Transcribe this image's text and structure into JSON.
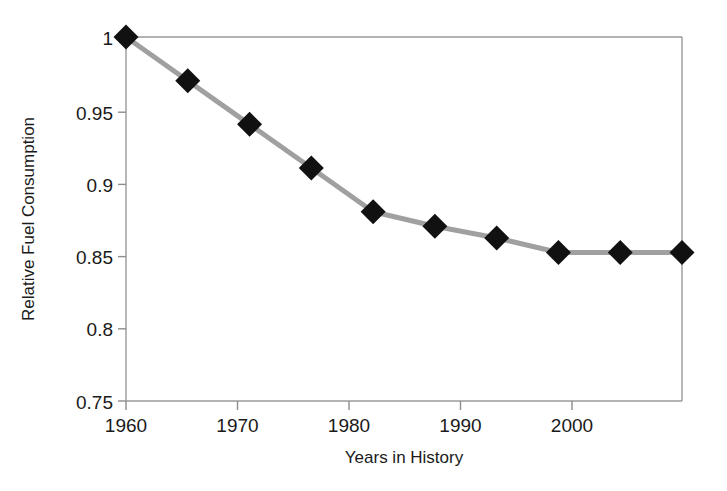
{
  "chart_data": {
    "type": "line",
    "title": "",
    "xlabel": "Years in History",
    "ylabel": "Relative Fuel Consumption",
    "xlim": [
      1960,
      2005
    ],
    "ylim": [
      0.75,
      1.0
    ],
    "grid": false,
    "legend": "none",
    "x": [
      1960,
      1965,
      1970,
      1975,
      1980,
      1985,
      1990,
      1995,
      2000,
      2005
    ],
    "values": [
      1.0,
      0.97,
      0.94,
      0.91,
      0.88,
      0.87,
      0.862,
      0.852,
      0.852,
      0.852
    ],
    "series": [
      {
        "name": "Relative Fuel Consumption",
        "values": [
          1.0,
          0.97,
          0.94,
          0.91,
          0.88,
          0.87,
          0.862,
          0.852,
          0.852,
          0.852
        ]
      }
    ],
    "x_ticks": [
      1960,
      1970,
      1980,
      1990,
      2000
    ],
    "x_tick_labels": [
      "1960",
      "1970",
      "1980",
      "1990",
      "2000"
    ],
    "y_ticks": [
      0.75,
      0.8,
      0.85,
      0.9,
      0.95,
      1.0
    ],
    "y_tick_labels": [
      "0.75",
      "0.8",
      "0.85",
      "0.9",
      "0.95",
      "1"
    ],
    "marker": "diamond",
    "marker_color": "#111111",
    "line_color": "#a0a0a0",
    "frame_color": "#9a9a9a",
    "background_color": "#ffffff"
  },
  "axes": {
    "x_title": "Years in History",
    "y_title": "Relative Fuel Consumption"
  },
  "ticks": {
    "x": [
      "1960",
      "1970",
      "1980",
      "1990",
      "2000"
    ],
    "y": [
      "1",
      "0.95",
      "0.9",
      "0.85",
      "0.8",
      "0.75"
    ]
  }
}
